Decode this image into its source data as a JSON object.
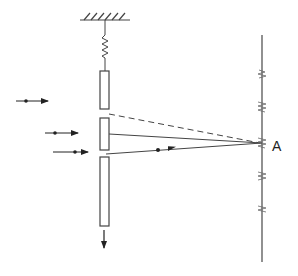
{
  "diagram": {
    "point_label": "A",
    "colors": {
      "stroke": "#444444",
      "screen": "#555555",
      "background": "#ffffff"
    },
    "elements": {
      "ceiling": "hatched-support",
      "spring": "spring",
      "slit_plates": [
        "top-plate",
        "middle-plate",
        "bottom-plate"
      ],
      "incoming_particles": 3,
      "screen": "detection-screen",
      "motion_arrow": "down-arrow",
      "paths": [
        "dashed-path",
        "upper-slit-path",
        "lower-slit-path"
      ]
    }
  }
}
